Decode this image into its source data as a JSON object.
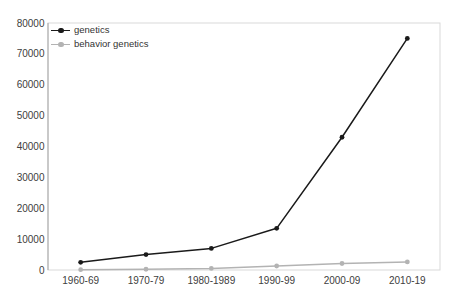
{
  "chart_data": {
    "type": "line",
    "title": "",
    "xlabel": "",
    "ylabel": "",
    "categories": [
      "1960-69",
      "1970-79",
      "1980-1989",
      "1990-99",
      "2000-09",
      "2010-19"
    ],
    "series": [
      {
        "name": "genetics",
        "color": "#1a1a1a",
        "values": [
          2500,
          5000,
          7000,
          13500,
          43000,
          75000
        ]
      },
      {
        "name": "behavior genetics",
        "color": "#b3b3b3",
        "values": [
          100,
          250,
          500,
          1300,
          2100,
          2600
        ]
      }
    ],
    "ylim": [
      0,
      80000
    ],
    "ytick_interval": 10000,
    "ytick_labels": [
      "0",
      "10000",
      "20000",
      "30000",
      "40000",
      "50000",
      "60000",
      "70000",
      "80000"
    ],
    "grid": false,
    "legend_position": "top-left",
    "colors": {
      "plot_border": "#d9d9d9",
      "y_axis_line": "#a6a6a6",
      "tick_label": "#404040"
    }
  }
}
